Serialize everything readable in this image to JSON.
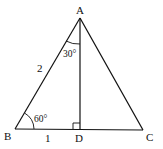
{
  "diagram": {
    "type": "triangle",
    "points": {
      "A": {
        "label": "A",
        "x": 80,
        "y": 18
      },
      "B": {
        "label": "B",
        "x": 15,
        "y": 129
      },
      "C": {
        "label": "C",
        "x": 143,
        "y": 130
      },
      "D": {
        "label": "D",
        "x": 80,
        "y": 129
      }
    },
    "segments": [
      "AB",
      "AC",
      "BC",
      "AD"
    ],
    "labels": {
      "side_AB": "2",
      "side_BD": "1",
      "angle_B": "60°",
      "angle_BAD": "30°"
    },
    "right_angle_at": "D",
    "colors": {
      "stroke": "#111111",
      "background": "#ffffff"
    }
  }
}
